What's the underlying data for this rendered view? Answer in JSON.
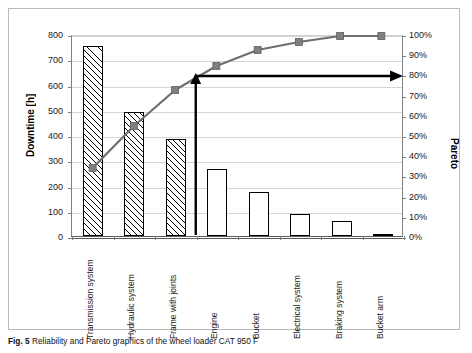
{
  "figure": {
    "caption_label": "Fig. 5",
    "caption_text": "Reliability and Pareto graphics of the wheel loader CAT 950 F"
  },
  "chart_data": {
    "type": "bar",
    "title": "",
    "categories": [
      "Transmission system",
      "Hydraulic system",
      "Frame with joints",
      "Engine",
      "Bucket",
      "Electrical system",
      "Braking system",
      "Bucket arm"
    ],
    "series": [
      {
        "name": "Downtime [h]",
        "kind": "bar",
        "values": [
          752,
          490,
          386,
          266,
          173,
          88,
          60,
          5
        ],
        "axis": "left"
      },
      {
        "name": "Pareto",
        "kind": "line",
        "values": [
          34,
          55,
          73,
          85,
          93,
          97,
          100,
          100
        ],
        "axis": "right"
      }
    ],
    "xlabel": "",
    "ylabel": "Downtime [h]",
    "ylabel_right": "Pareto",
    "ylim": [
      0,
      800
    ],
    "ylim_right": [
      0,
      100
    ],
    "yticks": [
      "0",
      "100",
      "200",
      "300",
      "400",
      "500",
      "600",
      "700",
      "800"
    ],
    "yticks_right": [
      "0%",
      "10%",
      "20%",
      "30%",
      "40%",
      "50%",
      "60%",
      "70%",
      "80%",
      "90%",
      "100%"
    ],
    "grid": true,
    "legend": "none",
    "bar_patterns": [
      "hatch",
      "hatch",
      "hatch",
      "dots",
      "dots",
      "dots",
      "dots",
      "flat"
    ],
    "annotations": [
      {
        "name": "vertical-threshold-arrow",
        "type": "arrow",
        "from_category_index": 3,
        "description": "vertical arrow at boundary before Engine pointing up to 80% Pareto level"
      },
      {
        "name": "horizontal-80-percent-arrow",
        "type": "arrow",
        "level_percent": 80,
        "description": "horizontal arrow at 80% Pareto level pointing right"
      }
    ],
    "colors": {
      "line": "#6e6e6e",
      "marker": "#808080",
      "bar_edge": "#000000",
      "grid": "#d6d6d6",
      "axis": "#7f7f7f",
      "annotation": "#000000"
    }
  }
}
